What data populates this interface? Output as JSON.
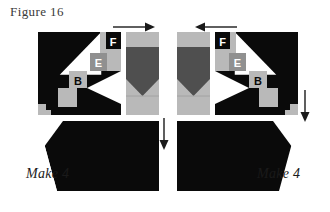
{
  "figure": {
    "title": "Figure 16"
  },
  "colors": {
    "black": "#0a0a0a",
    "white": "#ffffff",
    "light_gray": "#b9b9b9",
    "mid_gray": "#909090",
    "dark_gray": "#4f4f4f",
    "text_dark": "#1a1a1a",
    "title_gray": "#3a3a3a"
  },
  "left_group": {
    "name": "left-block-group",
    "arrow": {
      "name": "arrow-right",
      "direction": "right",
      "label": "→"
    },
    "arrow_down": {
      "name": "arrow-down",
      "direction": "down",
      "label": "↓"
    },
    "patch_letters": [
      {
        "letter": "F",
        "fill": "black",
        "text_color": "white"
      },
      {
        "letter": "E",
        "fill": "mid_gray",
        "text_color": "white"
      },
      {
        "letter": "B",
        "fill": "light_gray",
        "text_color": "black"
      }
    ],
    "make_label": "Make 4"
  },
  "right_group": {
    "name": "right-block-group",
    "arrow": {
      "name": "arrow-left",
      "direction": "left",
      "label": "←"
    },
    "arrow_down": {
      "name": "arrow-down",
      "direction": "down",
      "label": "↓"
    },
    "patch_letters": [
      {
        "letter": "F",
        "fill": "black",
        "text_color": "white"
      },
      {
        "letter": "E",
        "fill": "mid_gray",
        "text_color": "white"
      },
      {
        "letter": "B",
        "fill": "light_gray",
        "text_color": "black"
      }
    ],
    "make_label": "Make 4"
  }
}
